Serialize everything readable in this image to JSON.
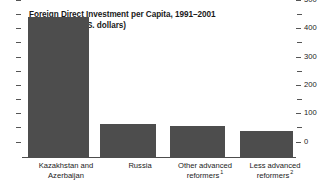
{
  "chart_data": {
    "type": "bar",
    "title": "Foreign Direct Investment per Capita, 1991–2001",
    "subtitle": "(cumulative; U.S. dollars)",
    "xlabel": "",
    "ylabel": "",
    "ylim": [
      0,
      500
    ],
    "y_axis_position": "right",
    "grid": false,
    "legend": "none",
    "major_tick_step": 100,
    "minor_tick_step": 50,
    "tick_labels": [
      "0",
      "100",
      "200",
      "300",
      "400",
      "500"
    ],
    "tick_values": [
      0,
      100,
      200,
      300,
      400,
      500
    ],
    "bar_color": "#4d4d4d",
    "categories": [
      "Kazakhstan and Azerbaijan",
      "Russia",
      "Other advanced reformers",
      "Less advanced reformers"
    ],
    "category_lines": [
      {
        "line1": "Kazakhstan and",
        "line2": "Azerbaijan",
        "footnote": ""
      },
      {
        "line1": "Russia",
        "line2": "",
        "footnote": ""
      },
      {
        "line1": "Other advanced",
        "line2": "reformers",
        "footnote": "1"
      },
      {
        "line1": "Less advanced",
        "line2": "reformers",
        "footnote": "2"
      }
    ],
    "values": [
      498,
      120,
      113,
      93
    ],
    "bar_geometry": [
      {
        "left": 6,
        "width": 61
      },
      {
        "left": 78,
        "width": 56
      },
      {
        "left": 148,
        "width": 55
      },
      {
        "left": 218,
        "width": 53
      }
    ],
    "category_geometry": [
      {
        "left": 14,
        "width": 104
      },
      {
        "left": 78,
        "width": 124
      },
      {
        "left": 142,
        "width": 126
      },
      {
        "left": 212,
        "width": 126
      }
    ]
  }
}
